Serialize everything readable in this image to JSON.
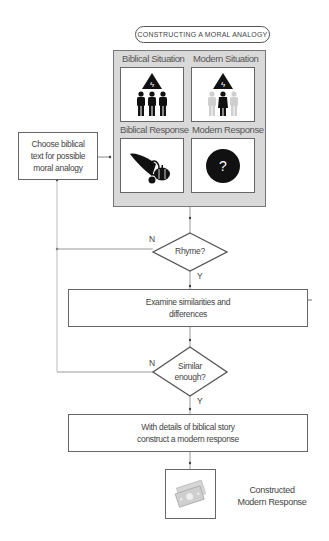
{
  "title": "CONSTRUCTING A MORAL ANALOGY",
  "panel": {
    "cells": [
      {
        "label": "Biblical Situation",
        "icon": "warning-triangle-with-three-people-icon"
      },
      {
        "label": "Modern Situation",
        "icon": "warning-triangle-with-one-highlighted-person-icon"
      },
      {
        "label": "Biblical Response",
        "icon": "cornucopia-harvest-icon"
      },
      {
        "label": "Modern Response",
        "icon": "question-mark-circle-icon",
        "glyph": "?"
      }
    ]
  },
  "start_box": {
    "lines": [
      "Choose biblical",
      "text for possible",
      "moral analogy"
    ]
  },
  "decision1": {
    "text": "Rhyme?",
    "no_label": "N",
    "yes_label": "Y"
  },
  "step1": {
    "lines": [
      "Examine similarities and",
      "differences"
    ]
  },
  "decision2": {
    "lines": [
      "Similar",
      "enough?"
    ],
    "no_label": "N",
    "yes_label": "Y"
  },
  "step2": {
    "lines": [
      "With details of biblical story",
      "construct a modern response"
    ]
  },
  "result": {
    "icon": "money-bills-icon",
    "lines": [
      "Constructed",
      "Modern Response"
    ]
  },
  "colors": {
    "panel_bg": "#d9d9d9",
    "stroke": "#666666",
    "line": "#999999",
    "icon_dark": "#111111",
    "icon_light": "#cccccc"
  }
}
